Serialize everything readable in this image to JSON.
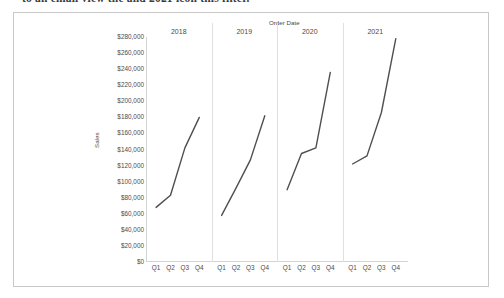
{
  "document": {
    "clipped_text_line": "to an email view the and 2021 icon this filter."
  },
  "chart_data": {
    "type": "line",
    "title": "Order Date",
    "xlabel": "",
    "ylabel": "Sales",
    "ylim": [
      0,
      280000
    ],
    "ytick_labels": [
      "$280,000",
      "$260,000",
      "$240,000",
      "$220,000",
      "$200,000",
      "$180,000",
      "$160,000",
      "$140,000",
      "$120,000",
      "$100,000",
      "$80,000",
      "$60,000",
      "$40,000",
      "$20,000",
      "$0"
    ],
    "ytick_values": [
      280000,
      260000,
      240000,
      220000,
      200000,
      180000,
      160000,
      140000,
      120000,
      100000,
      80000,
      60000,
      40000,
      20000,
      0
    ],
    "grid": false,
    "legend": "none",
    "line_color": "#4f4f4f",
    "panel_by": "year",
    "categories": [
      "Q1",
      "Q2",
      "Q3",
      "Q4"
    ],
    "panels": [
      {
        "label": "2018",
        "values": [
          68000,
          83000,
          142000,
          180000
        ]
      },
      {
        "label": "2019",
        "values": [
          58000,
          92000,
          127000,
          182000
        ]
      },
      {
        "label": "2020",
        "values": [
          90000,
          135000,
          142000,
          236000
        ]
      },
      {
        "label": "2021",
        "values": [
          122000,
          132000,
          186000,
          278000
        ]
      }
    ]
  }
}
